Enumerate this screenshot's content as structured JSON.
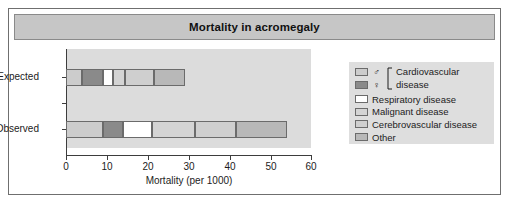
{
  "title": "Mortality in acromegaly",
  "chart_data": {
    "type": "bar",
    "orientation": "horizontal",
    "stacked": true,
    "title": "Mortality in acromegaly",
    "xlabel": "Mortality (per 1000)",
    "ylabel": "",
    "xlim": [
      0,
      60
    ],
    "xticks": [
      0,
      10,
      20,
      30,
      40,
      50,
      60
    ],
    "xticklabels": [
      "0",
      "10",
      "20",
      "30",
      "40",
      "50",
      "60"
    ],
    "categories": [
      "Expected",
      "Observed"
    ],
    "grid": false,
    "legend_position": "right",
    "series": [
      {
        "name": "Cardiovascular disease ♂",
        "key": "cv_male",
        "color": "#cccccc",
        "values": [
          4.0,
          9.0
        ]
      },
      {
        "name": "Cardiovascular disease ♀",
        "key": "cv_female",
        "color": "#8a8a8a",
        "values": [
          5.0,
          5.0
        ]
      },
      {
        "name": "Respiratory disease",
        "key": "respiratory",
        "color": "#ffffff",
        "values": [
          2.5,
          7.0
        ]
      },
      {
        "name": "Malignant disease",
        "key": "malignant",
        "color": "#d4d4d4",
        "values": [
          3.0,
          10.5
        ]
      },
      {
        "name": "Cerebrovascular disease",
        "key": "cerebro",
        "color": "#cfcfcf",
        "values": [
          7.0,
          10.0
        ]
      },
      {
        "name": "Other",
        "key": "other",
        "color": "#b8b8b8",
        "values": [
          7.5,
          12.5
        ]
      }
    ],
    "totals": [
      29.0,
      54.0
    ],
    "annotations": []
  },
  "legend": {
    "cardiovascular_group": {
      "male_symbol": "♂",
      "female_symbol": "♀",
      "label_line1": "Cardiovascular",
      "label_line2": "disease",
      "male_color": "#cccccc",
      "female_color": "#8a8a8a"
    },
    "items": [
      {
        "label": "Respiratory disease",
        "color": "#ffffff"
      },
      {
        "label": "Malignant disease",
        "color": "#d4d4d4"
      },
      {
        "label": "Cerebrovascular disease",
        "color": "#cfcfcf"
      },
      {
        "label": "Other",
        "color": "#b8b8b8"
      }
    ]
  },
  "axis": {
    "x_label": "Mortality (per 1000)",
    "x_ticks": [
      "0",
      "10",
      "20",
      "30",
      "40",
      "50",
      "60"
    ],
    "y_ticks": [
      "Expected",
      "Observed"
    ]
  },
  "colors": {
    "figure_background": "#ffffff",
    "title_bar": "#c6c6c6",
    "plot_background": "#dcdcdc",
    "legend_background": "#dedede",
    "axis_line": "#3d3d3d",
    "border": "#6f6f6f"
  }
}
